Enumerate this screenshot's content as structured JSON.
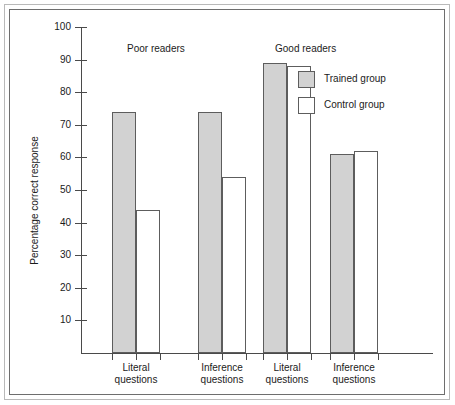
{
  "chart_data": {
    "type": "bar",
    "title": "",
    "xlabel": "",
    "ylabel": "Percentage correct response",
    "ylim": [
      0,
      100
    ],
    "ytick_labels": [
      "100",
      "90",
      "80",
      "70",
      "60",
      "50",
      "40",
      "30",
      "20",
      "10"
    ],
    "ytick_values": [
      100,
      90,
      80,
      70,
      60,
      50,
      40,
      30,
      20,
      10
    ],
    "grid": false,
    "legend_position": "top-right",
    "group_headers": [
      "Poor readers",
      "Good readers"
    ],
    "categories": [
      {
        "line1": "Literal",
        "line2": "questions",
        "group": "Poor readers"
      },
      {
        "line1": "Inference",
        "line2": "questions",
        "group": "Poor readers"
      },
      {
        "line1": "Literal",
        "line2": "questions",
        "group": "Good readers"
      },
      {
        "line1": "Inference",
        "line2": "questions",
        "group": "Good readers"
      }
    ],
    "series": [
      {
        "name": "Trained group",
        "color": "#d2d2d2",
        "values": [
          74,
          74,
          89,
          61
        ]
      },
      {
        "name": "Control group",
        "color": "#ffffff",
        "values": [
          44,
          54,
          88,
          62
        ]
      }
    ]
  },
  "legend": {
    "items": [
      {
        "label": "Trained group",
        "swatch": "trained"
      },
      {
        "label": "Control group",
        "swatch": "control"
      }
    ]
  },
  "colors": {
    "bar_fill_trained": "#d2d2d2",
    "bar_fill_control": "#ffffff",
    "bar_stroke": "#5d5d5d",
    "axis": "#4a4a4a",
    "text": "#1b1b1b",
    "frame_outer": "#b9b9b9",
    "frame_inner": "#6e6e6e"
  }
}
